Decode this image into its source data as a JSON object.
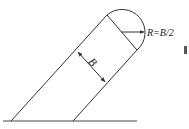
{
  "diagram": {
    "labels": {
      "width": "B",
      "radius": "R=B/2"
    },
    "colors": {
      "line": "#333333",
      "text": "#222222",
      "background": "#ffffff"
    }
  }
}
